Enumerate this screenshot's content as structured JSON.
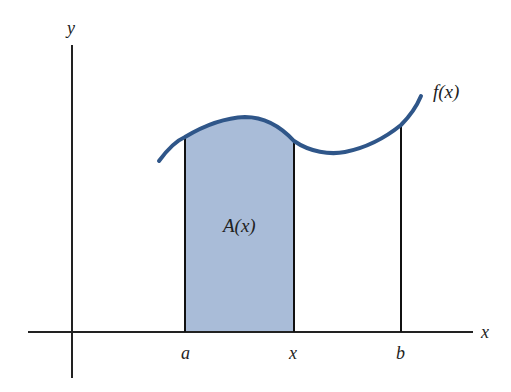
{
  "diagram": {
    "type": "area-under-curve",
    "colors": {
      "curve": "#2f5689",
      "fill": "#a9bcd8",
      "axes": "#222222",
      "background": "#ffffff"
    },
    "labels": {
      "y_axis": "y",
      "x_axis": "x",
      "function": "f(x)",
      "area": "A(x)",
      "tick_a": "a",
      "tick_x": "x",
      "tick_b": "b"
    }
  }
}
